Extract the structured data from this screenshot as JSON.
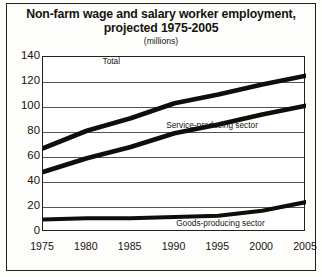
{
  "chart_data": {
    "type": "line",
    "title": "Non-farm wage and salary worker employment, projected 1975-2005",
    "title_line1": "Non-farm wage and salary worker employment,",
    "title_line2": "projected 1975-2005",
    "subtitle": "(millions)",
    "xlabel": "",
    "ylabel": "",
    "categories": [
      "1975",
      "1980",
      "1985",
      "1990",
      "1995",
      "2000",
      "2005"
    ],
    "x": [
      1975,
      1980,
      1985,
      1990,
      1995,
      2000,
      2005
    ],
    "xlim": [
      1975,
      2005
    ],
    "ylim": [
      0,
      140
    ],
    "yticks": [
      "0",
      "20",
      "40",
      "60",
      "80",
      "100",
      "120",
      "140"
    ],
    "ytick_values": [
      0,
      20,
      40,
      60,
      80,
      100,
      120,
      140
    ],
    "grid": true,
    "legend_position": "inline-annotations",
    "series": [
      {
        "name": "Total",
        "values": [
          67,
          81,
          91,
          103,
          110,
          118,
          125
        ]
      },
      {
        "name": "Service-producing sector",
        "values": [
          48,
          59,
          68,
          79,
          86,
          94,
          101
        ]
      },
      {
        "name": "Goods-producing sector",
        "values": [
          10,
          11,
          11,
          12,
          13,
          17,
          24
        ]
      }
    ],
    "annotations": [
      {
        "text": "Total",
        "series": "Total"
      },
      {
        "text": "Service-producing sector",
        "series": "Service-producing sector"
      },
      {
        "text": "Goods-producing sector",
        "series": "Goods-producing sector"
      }
    ],
    "line_color": "#100e0b",
    "grid_color": "#59544d",
    "frame_color": "#22201c",
    "background": "#ffffff"
  }
}
